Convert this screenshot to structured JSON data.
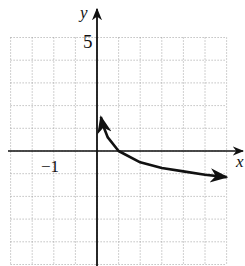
{
  "chart_data": {
    "type": "line",
    "title": "",
    "xlabel": "x",
    "ylabel": "y",
    "xlim": [
      -4,
      6
    ],
    "ylim": [
      -5,
      5
    ],
    "grid": true,
    "grid_style": "dotted",
    "tick_labels": {
      "y": [
        "5"
      ],
      "x": [
        "-1"
      ]
    },
    "series": [
      {
        "name": "curve",
        "description": "decreasing logarithmic-type curve with vertical asymptote at x=0, passing through (1,0), arrows at both ends",
        "x": [
          0.18,
          0.25,
          0.5,
          1,
          2,
          3,
          4,
          5,
          6
        ],
        "y": [
          1.5,
          1.2,
          0.6,
          0,
          -0.5,
          -0.75,
          -0.9,
          -1.05,
          -1.15
        ]
      }
    ]
  },
  "labels": {
    "y_axis": "y",
    "x_axis": "x",
    "tick_y_top": "5",
    "tick_y_minus1": "−1"
  },
  "colors": {
    "curve": "#111111",
    "axes": "#111111",
    "grid": "#8a8a8a"
  }
}
